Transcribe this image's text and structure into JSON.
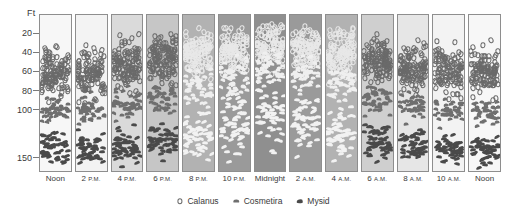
{
  "chart_data": {
    "type": "scatter",
    "title": "",
    "ylabel": "Ft",
    "xlabel": "",
    "ylim": [
      0,
      165
    ],
    "grid": false,
    "legend_position": "bottom-center",
    "y_ticks": [
      {
        "label": "20",
        "value": 20
      },
      {
        "label": "40",
        "value": 40
      },
      {
        "label": "60",
        "value": 60
      },
      {
        "label": "80",
        "value": 80
      },
      {
        "label": "100",
        "value": 100
      },
      {
        "label": "150",
        "value": 150
      }
    ],
    "categories": [
      "Noon",
      "2 P.M.",
      "4 P.M.",
      "6 P.M.",
      "8 P.M.",
      "10 P.M.",
      "Midnight",
      "2 A.M.",
      "4 A.M.",
      "6 A.M.",
      "8 A.M.",
      "10 A.M.",
      "Noon"
    ],
    "series": [
      {
        "name": "Calanus",
        "symbol": "open-circle",
        "depth_band_ft": [
          40,
          100
        ]
      },
      {
        "name": "Cosmetira",
        "symbol": "dome",
        "depth_band_ft": [
          80,
          130
        ]
      },
      {
        "name": "Mysid",
        "symbol": "comma",
        "depth_band_ft": [
          110,
          160
        ]
      }
    ],
    "columns": [
      {
        "time": "Noon",
        "period": "",
        "darkness": 0.02,
        "calanus": {
          "top_ft": 18,
          "bottom_ft": 95,
          "peak_ft": 65,
          "count": 120
        },
        "cosmetira": {
          "top_ft": 78,
          "bottom_ft": 120,
          "peak_ft": 95,
          "count": 46
        },
        "mysid": {
          "top_ft": 108,
          "bottom_ft": 160,
          "peak_ft": 152,
          "count": 52
        }
      },
      {
        "time": "2",
        "period": "P.M.",
        "darkness": 0.05,
        "calanus": {
          "top_ft": 16,
          "bottom_ft": 100,
          "peak_ft": 62,
          "count": 115
        },
        "cosmetira": {
          "top_ft": 80,
          "bottom_ft": 122,
          "peak_ft": 96,
          "count": 44
        },
        "mysid": {
          "top_ft": 112,
          "bottom_ft": 160,
          "peak_ft": 152,
          "count": 50
        }
      },
      {
        "time": "4",
        "period": "P.M.",
        "darkness": 0.22,
        "calanus": {
          "top_ft": 12,
          "bottom_ft": 92,
          "peak_ft": 52,
          "count": 128
        },
        "cosmetira": {
          "top_ft": 70,
          "bottom_ft": 118,
          "peak_ft": 92,
          "count": 48
        },
        "mysid": {
          "top_ft": 105,
          "bottom_ft": 160,
          "peak_ft": 150,
          "count": 54
        }
      },
      {
        "time": "6",
        "period": "P.M.",
        "darkness": 0.36,
        "calanus": {
          "top_ft": 8,
          "bottom_ft": 85,
          "peak_ft": 42,
          "count": 132
        },
        "cosmetira": {
          "top_ft": 60,
          "bottom_ft": 112,
          "peak_ft": 85,
          "count": 50
        },
        "mysid": {
          "top_ft": 95,
          "bottom_ft": 160,
          "peak_ft": 148,
          "count": 56
        }
      },
      {
        "time": "8",
        "period": "P.M.",
        "darkness": 0.5,
        "calanus": {
          "top_ft": 6,
          "bottom_ft": 80,
          "peak_ft": 35,
          "count": 130
        },
        "cosmetira": {
          "top_ft": 48,
          "bottom_ft": 105,
          "peak_ft": 75,
          "count": 52
        },
        "mysid": {
          "top_ft": 80,
          "bottom_ft": 160,
          "peak_ft": 142,
          "count": 58
        }
      },
      {
        "time": "10",
        "period": "P.M.",
        "darkness": 0.66,
        "calanus": {
          "top_ft": 4,
          "bottom_ft": 75,
          "peak_ft": 28,
          "count": 124
        },
        "cosmetira": {
          "top_ft": 35,
          "bottom_ft": 100,
          "peak_ft": 62,
          "count": 52
        },
        "mysid": {
          "top_ft": 60,
          "bottom_ft": 160,
          "peak_ft": 130,
          "count": 58
        }
      },
      {
        "time": "Midnight",
        "period": "",
        "darkness": 0.74,
        "calanus": {
          "top_ft": 3,
          "bottom_ft": 70,
          "peak_ft": 24,
          "count": 120
        },
        "cosmetira": {
          "top_ft": 25,
          "bottom_ft": 95,
          "peak_ft": 52,
          "count": 50
        },
        "mysid": {
          "top_ft": 40,
          "bottom_ft": 160,
          "peak_ft": 118,
          "count": 56
        }
      },
      {
        "time": "2",
        "period": "A.M.",
        "darkness": 0.66,
        "calanus": {
          "top_ft": 4,
          "bottom_ft": 74,
          "peak_ft": 28,
          "count": 122
        },
        "cosmetira": {
          "top_ft": 32,
          "bottom_ft": 98,
          "peak_ft": 58,
          "count": 50
        },
        "mysid": {
          "top_ft": 55,
          "bottom_ft": 160,
          "peak_ft": 126,
          "count": 56
        }
      },
      {
        "time": "4",
        "period": "A.M.",
        "darkness": 0.5,
        "calanus": {
          "top_ft": 6,
          "bottom_ft": 80,
          "peak_ft": 36,
          "count": 126
        },
        "cosmetira": {
          "top_ft": 46,
          "bottom_ft": 104,
          "peak_ft": 74,
          "count": 50
        },
        "mysid": {
          "top_ft": 78,
          "bottom_ft": 160,
          "peak_ft": 140,
          "count": 56
        }
      },
      {
        "time": "6",
        "period": "A.M.",
        "darkness": 0.3,
        "calanus": {
          "top_ft": 10,
          "bottom_ft": 88,
          "peak_ft": 46,
          "count": 128
        },
        "cosmetira": {
          "top_ft": 62,
          "bottom_ft": 112,
          "peak_ft": 86,
          "count": 48
        },
        "mysid": {
          "top_ft": 98,
          "bottom_ft": 160,
          "peak_ft": 148,
          "count": 54
        }
      },
      {
        "time": "8",
        "period": "A.M.",
        "darkness": 0.14,
        "calanus": {
          "top_ft": 14,
          "bottom_ft": 95,
          "peak_ft": 58,
          "count": 120
        },
        "cosmetira": {
          "top_ft": 74,
          "bottom_ft": 118,
          "peak_ft": 93,
          "count": 46
        },
        "mysid": {
          "top_ft": 106,
          "bottom_ft": 160,
          "peak_ft": 151,
          "count": 52
        }
      },
      {
        "time": "10",
        "period": "A.M.",
        "darkness": 0.05,
        "calanus": {
          "top_ft": 16,
          "bottom_ft": 98,
          "peak_ft": 63,
          "count": 114
        },
        "cosmetira": {
          "top_ft": 80,
          "bottom_ft": 122,
          "peak_ft": 97,
          "count": 44
        },
        "mysid": {
          "top_ft": 112,
          "bottom_ft": 160,
          "peak_ft": 153,
          "count": 50
        }
      },
      {
        "time": "Noon",
        "period": "",
        "darkness": 0.02,
        "calanus": {
          "top_ft": 18,
          "bottom_ft": 100,
          "peak_ft": 66,
          "count": 118
        },
        "cosmetira": {
          "top_ft": 82,
          "bottom_ft": 124,
          "peak_ft": 98,
          "count": 44
        },
        "mysid": {
          "top_ft": 114,
          "bottom_ft": 160,
          "peak_ft": 153,
          "count": 50
        }
      }
    ],
    "legend": [
      {
        "label": "Calanus",
        "icon": "open-circle-icon"
      },
      {
        "label": "Cosmetira",
        "icon": "dome-icon"
      },
      {
        "label": "Mysid",
        "icon": "comma-icon"
      }
    ]
  }
}
